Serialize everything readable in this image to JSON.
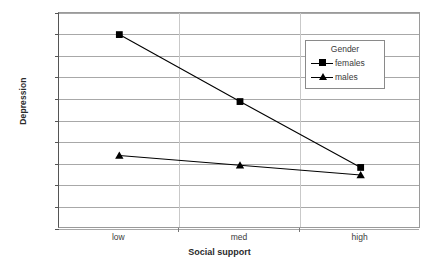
{
  "chart_data": {
    "type": "line",
    "title": "",
    "categories": [
      "low",
      "med",
      "high"
    ],
    "xlabel": "Social support",
    "ylabel": "Depression",
    "ylim": [
      4,
      14
    ],
    "yticks": [
      4,
      5,
      6,
      7,
      8,
      9,
      10,
      11,
      12,
      13,
      14
    ],
    "grid": true,
    "legend": {
      "title": "Gender",
      "position": "inside-top-right",
      "entries": [
        {
          "name": "females",
          "marker": "square"
        },
        {
          "name": "males",
          "marker": "triangle"
        }
      ]
    },
    "series": [
      {
        "name": "females",
        "marker": "square",
        "color": "#000000",
        "values": [
          13.0,
          9.9,
          6.85
        ]
      },
      {
        "name": "males",
        "marker": "triangle",
        "color": "#000000",
        "values": [
          7.4,
          6.95,
          6.5
        ]
      }
    ]
  },
  "axis": {
    "y_tick_labels": [
      "14",
      "13",
      "12",
      "11",
      "10",
      "9",
      "8",
      "7",
      "6",
      "5",
      "4"
    ],
    "x_tick_labels": [
      "low",
      "med",
      "high"
    ]
  },
  "legend": {
    "title": "Gender",
    "items": [
      {
        "label": "females"
      },
      {
        "label": "males"
      }
    ]
  },
  "labels": {
    "y_axis_title": "Depression",
    "x_axis_title": "Social support"
  }
}
